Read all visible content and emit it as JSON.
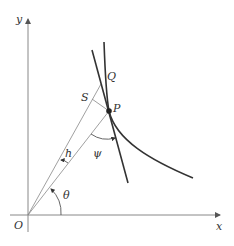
{
  "diagram": {
    "labels": {
      "y_axis": "y",
      "x_axis": "x",
      "origin": "O",
      "point_p": "P",
      "point_q": "Q",
      "point_s": "S",
      "angle_theta": "θ",
      "angle_psi": "ψ",
      "distance_h": "h"
    },
    "colors": {
      "axis": "#888888",
      "curve": "#333333",
      "thin_line": "#777777",
      "text": "#333333"
    }
  }
}
